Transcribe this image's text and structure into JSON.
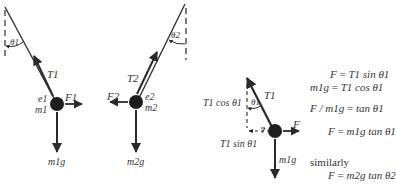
{
  "figure": {
    "pendulum_1": {
      "angle_label": "θ1",
      "tension_label": "T1",
      "charge_label": "e1",
      "mass_label": "m1",
      "force_label": "F1",
      "weight_label": "m1g"
    },
    "pendulum_2": {
      "angle_label": "θ2",
      "tension_label": "T2",
      "charge_label": "e2",
      "mass_label": "m2",
      "force_label": "F2",
      "weight_label": "m2g"
    },
    "free_body": {
      "angle_label": "θ1",
      "tension_label": "T1",
      "vertical_component_label": "T1 cos θ1",
      "horizontal_component_label": "T1 sin θ1",
      "force_label": "F",
      "weight_label": "m1g"
    },
    "equations": [
      {
        "lhs": "F",
        "rhs": "T1 sin θ1"
      },
      {
        "lhs": "m1g",
        "rhs": "T1 cos θ1"
      },
      {
        "lhs": "F / m1g",
        "rhs": "tan θ1"
      },
      {
        "lhs": "F",
        "rhs": "m1g tan θ1"
      }
    ],
    "similarly_label": "similarly",
    "similarly_equation": {
      "lhs": "F",
      "rhs": "m2g tan θ2"
    }
  },
  "colors": {
    "ink": "#2a2a2a",
    "background": "#ffffff"
  }
}
